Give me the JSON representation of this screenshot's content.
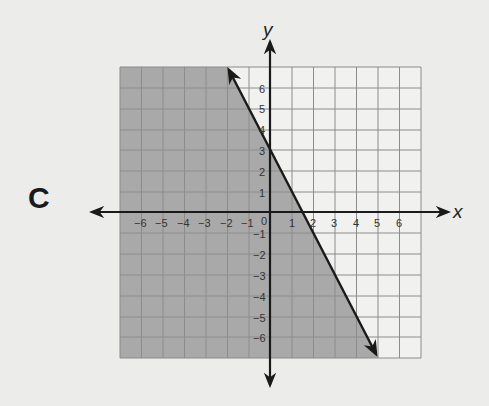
{
  "problem_label": "C",
  "graph": {
    "x_axis_label": "x",
    "y_axis_label": "y",
    "x_ticks": [
      "−6",
      "−5",
      "−4",
      "−3",
      "−2",
      "−1",
      "0",
      "1",
      "2",
      "3",
      "4",
      "5",
      "6"
    ],
    "y_ticks_positive": [
      "6",
      "5",
      "4",
      "3",
      "2",
      "1"
    ],
    "y_ticks_negative": [
      "−1",
      "−2",
      "−3",
      "−4",
      "−5",
      "−6"
    ],
    "grid_range": {
      "xmin": -7,
      "xmax": 7,
      "ymin": -7,
      "ymax": 7
    },
    "boundary_line": {
      "equation": "y = -2x + 3",
      "style": "solid",
      "y_intercept": 3,
      "x_intercept": 1.5,
      "arrow_ends": [
        [
          -2,
          7
        ],
        [
          5,
          -7
        ]
      ]
    },
    "shaded_region": "left of / below line (y ≤ −2x + 3)",
    "colors": {
      "shade": "#a9a9a9",
      "grid_line": "#8c8c8c",
      "unshaded": "#f1f1ef",
      "axis": "#1a1a1a"
    }
  }
}
